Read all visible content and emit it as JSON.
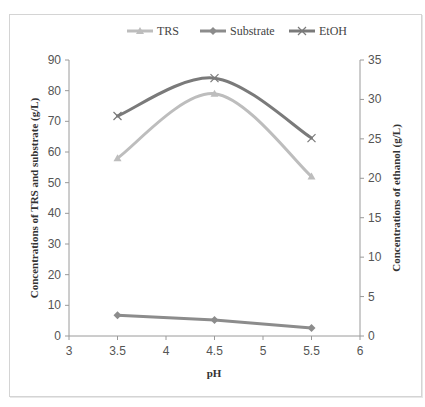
{
  "chart_data": {
    "type": "line",
    "title": "",
    "x": [
      3.5,
      4.5,
      5.5
    ],
    "xlabel": "pH",
    "xlim": [
      3,
      6
    ],
    "xticks": [
      "3",
      "3.5",
      "4",
      "4.5",
      "5",
      "5.5",
      "6"
    ],
    "ylabel": "Concentrations of TRS and substrate (g/L)",
    "ylim": [
      0,
      90
    ],
    "yticks": [
      "0",
      "10",
      "20",
      "30",
      "40",
      "50",
      "60",
      "70",
      "80",
      "90"
    ],
    "y2label": "Concentrations of ethanol (g/L)",
    "y2lim": [
      0,
      35
    ],
    "y2ticks": [
      "0",
      "5",
      "10",
      "15",
      "20",
      "25",
      "30",
      "35"
    ],
    "grid": false,
    "legend_position": "top",
    "series": [
      {
        "name": "TRS",
        "axis": "left",
        "marker": "triangle",
        "smooth": true,
        "color": "#bdbdbd",
        "values": [
          58,
          79,
          52
        ]
      },
      {
        "name": "Substrate",
        "axis": "left",
        "marker": "diamond",
        "smooth": false,
        "color": "#8c8c8c",
        "values": [
          6.8,
          5.2,
          2.6
        ]
      },
      {
        "name": "EtOH",
        "axis": "right",
        "marker": "x",
        "smooth": true,
        "color": "#7a7a7a",
        "values": [
          27.9,
          32.7,
          25.1
        ]
      }
    ]
  },
  "legend": {
    "items": [
      "TRS",
      "Substrate",
      "EtOH"
    ]
  }
}
